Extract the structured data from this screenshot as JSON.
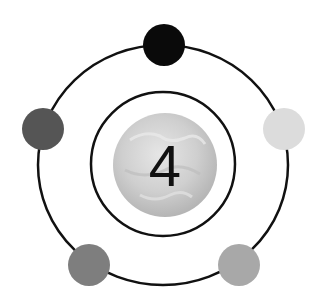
{
  "diagram": {
    "center_label": "4",
    "center_icon": "globe-icon",
    "outer_ring": {
      "cx": 163,
      "cy": 165,
      "rx": 125,
      "ry": 120,
      "stroke": "#111111"
    },
    "inner_ring": {
      "cx": 163,
      "cy": 164,
      "r": 72,
      "stroke": "#111111"
    },
    "globe": {
      "cx": 165,
      "cy": 165,
      "r": 52
    },
    "nodes": [
      {
        "name": "node-top",
        "cx": 164,
        "cy": 45,
        "r": 21,
        "color": "#0a0a0a"
      },
      {
        "name": "node-right",
        "cx": 284,
        "cy": 129,
        "r": 21,
        "color": "#dcdcdc"
      },
      {
        "name": "node-bottom-right",
        "cx": 239,
        "cy": 265,
        "r": 21,
        "color": "#a8a8a8"
      },
      {
        "name": "node-bottom-left",
        "cx": 89,
        "cy": 265,
        "r": 21,
        "color": "#7e7e7e"
      },
      {
        "name": "node-left",
        "cx": 43,
        "cy": 129,
        "r": 21,
        "color": "#555555"
      }
    ]
  }
}
